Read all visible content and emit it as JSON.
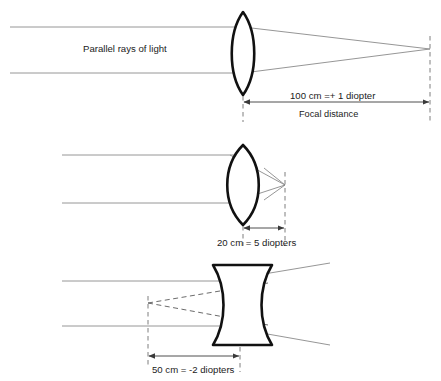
{
  "figure": {
    "background_color": "#ffffff",
    "lens_outline_color": "#111111",
    "ray_color": "#8a8a8a",
    "dimension_color": "#3a3a3a"
  },
  "diagrams": [
    {
      "id": "convex-weak",
      "lens_type": "biconvex",
      "incoming_label": "Parallel rays of light",
      "dimension_label": "100 cm =+ 1 diopter",
      "dimension_sublabel": "Focal distance",
      "focal_length_cm": 100,
      "diopters": 1
    },
    {
      "id": "convex-strong",
      "lens_type": "biconvex",
      "incoming_label": "",
      "dimension_label": "20 cm = 5 diopters",
      "dimension_sublabel": "",
      "focal_length_cm": 20,
      "diopters": 5
    },
    {
      "id": "concave",
      "lens_type": "biconcave",
      "incoming_label": "",
      "dimension_label": "50 cm = -2 diopters",
      "dimension_sublabel": "",
      "focal_length_cm": 50,
      "diopters": -2
    }
  ]
}
